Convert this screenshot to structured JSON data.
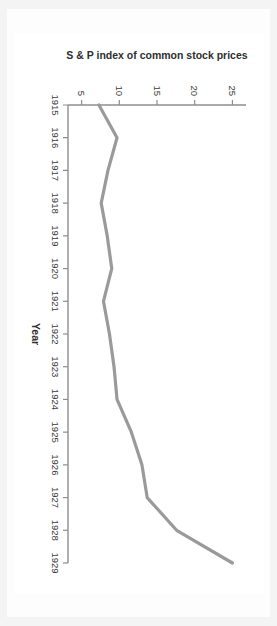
{
  "figure": {
    "rotation_degrees": 90,
    "background_color": "#ffffff",
    "frame_color": "#f4f4f4",
    "plot_background": "#ffffff"
  },
  "chart_data": {
    "type": "line",
    "title": "",
    "xlabel": "Year",
    "ylabel": "S & P index of common stock prices",
    "x": [
      1915,
      1916,
      1917,
      1918,
      1919,
      1920,
      1921,
      1922,
      1923,
      1924,
      1925,
      1926,
      1927,
      1928,
      1929
    ],
    "values": [
      7.3,
      9.7,
      8.5,
      7.6,
      8.4,
      9.0,
      7.9,
      8.7,
      9.3,
      9.7,
      11.6,
      13.0,
      13.7,
      17.6,
      25.0
    ],
    "series": [
      {
        "name": "S & P index of common stock prices",
        "color": "#9a9a9a",
        "values": [
          7.3,
          9.7,
          8.5,
          7.6,
          8.4,
          9.0,
          7.9,
          8.7,
          9.3,
          9.7,
          11.6,
          13.0,
          13.7,
          17.6,
          25.0
        ]
      }
    ],
    "categories": [
      "1915",
      "1916",
      "1917",
      "1918",
      "1919",
      "1920",
      "1921",
      "1922",
      "1923",
      "1924",
      "1925",
      "1926",
      "1927",
      "1928",
      "1929"
    ],
    "xtick_labels": [
      "1915",
      "1916",
      "1917",
      "1918",
      "1919",
      "1920",
      "1921",
      "1922",
      "1923",
      "1924",
      "1925",
      "1926",
      "1927",
      "1928",
      "1929"
    ],
    "ytick_labels": [
      "5",
      "10",
      "15",
      "20",
      "25"
    ],
    "ytick_values": [
      5,
      10,
      15,
      20,
      25
    ],
    "xlim": [
      1915,
      1929
    ],
    "ylim": [
      3.2,
      26.8
    ],
    "grid": false,
    "legend": false,
    "legend_position": "none",
    "line_color": "#9a9a9a",
    "axis_color": "#8e8e8e"
  },
  "axes": {
    "x_title": "Year",
    "y_title": "S & P index of common stock prices"
  }
}
